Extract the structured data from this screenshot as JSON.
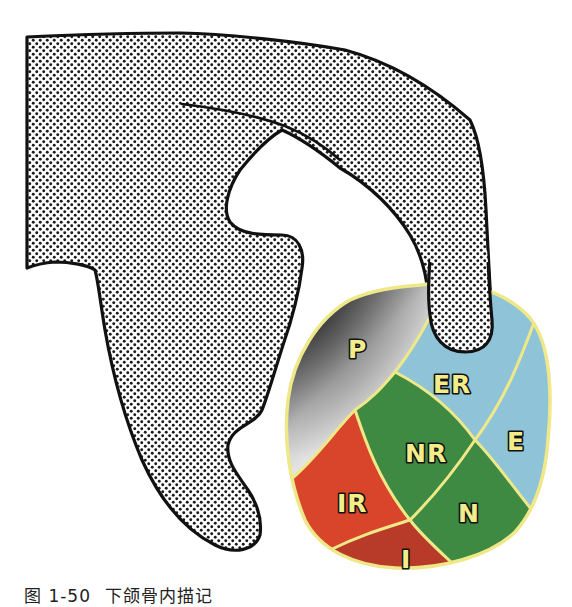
{
  "figure": {
    "caption": {
      "figure_number": "图 1-50",
      "title": "下颌骨内描记"
    },
    "outline_shape": {
      "description": "dotted halftone jaw/bone outline",
      "fill_pattern": "halftone-dots",
      "stroke_color": "#111111"
    },
    "regions": [
      {
        "id": "P",
        "label": "P",
        "color": "#c9c9c9",
        "fill": "gray-gradient"
      },
      {
        "id": "ER",
        "label": "ER",
        "color": "#8fc4d8"
      },
      {
        "id": "E",
        "label": "E",
        "color": "#8fc4d8"
      },
      {
        "id": "NR",
        "label": "NR",
        "color": "#3f8a43"
      },
      {
        "id": "N",
        "label": "N",
        "color": "#3f8a43"
      },
      {
        "id": "IR",
        "label": "IR",
        "color": "#d9452a"
      },
      {
        "id": "I",
        "label": "I",
        "color": "#b83a28"
      }
    ],
    "colors": {
      "label_fill": "#f2ec8a",
      "label_stroke": "#111111",
      "divider_lines": "#efe888",
      "oval_border": "#efe888"
    }
  }
}
